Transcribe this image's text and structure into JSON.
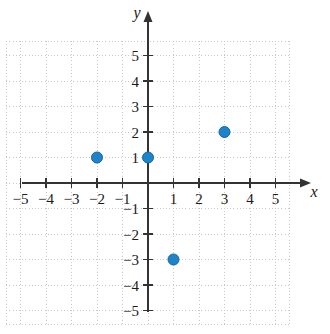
{
  "figure": {
    "background_color": "#ffffff",
    "axis_color": "#333333",
    "grid_color": "#c9c9c9",
    "point_color": "#1f83c9",
    "point_stroke_color": "#1565a8",
    "x_axis_name": "x",
    "y_axis_name": "y"
  },
  "chart_data": {
    "type": "scatter",
    "title": "",
    "subtitle": "",
    "xlabel": "x",
    "ylabel": "y",
    "xlim": [
      -5.8,
      5.8
    ],
    "ylim": [
      -5.8,
      5.8
    ],
    "grid": true,
    "grid_style": "dotted",
    "legend": false,
    "legend_position": "none",
    "x_ticks": [
      -5,
      -4,
      -3,
      -2,
      -1,
      1,
      2,
      3,
      4,
      5
    ],
    "y_ticks": [
      5,
      4,
      3,
      2,
      1,
      -1,
      -2,
      -3,
      -4,
      -5
    ],
    "x_tick_labels": [
      "−5",
      "−4",
      "−3",
      "−2",
      "−1",
      "1",
      "2",
      "3",
      "4",
      "5"
    ],
    "y_tick_labels": [
      "5",
      "4",
      "3",
      "2",
      "1",
      "−1",
      "−2",
      "−3",
      "−4",
      "−5"
    ],
    "points": [
      {
        "x": -2,
        "y": 1,
        "label": "(−2, 1)"
      },
      {
        "x": 0,
        "y": 1,
        "label": "(0, 1)"
      },
      {
        "x": 3,
        "y": 2,
        "label": "(3, 2)"
      },
      {
        "x": 1,
        "y": -3,
        "label": "(1, −3)"
      }
    ],
    "point_count": 4,
    "marker": "filled-circle",
    "marker_radius_px": 5.5
  }
}
